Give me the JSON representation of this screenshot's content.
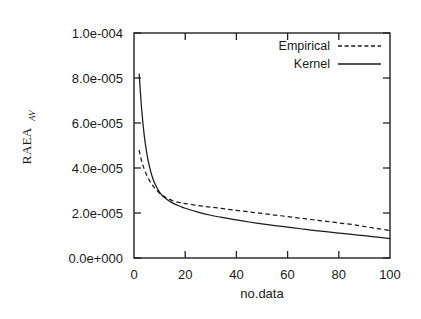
{
  "chart_data": {
    "type": "line",
    "title": "",
    "subtitle": "",
    "xlabel": "no.data",
    "ylabel": "RAEA",
    "ylabel_subscript": "AV",
    "xlim": [
      0,
      100
    ],
    "ylim": [
      0,
      0.0001
    ],
    "grid": false,
    "legend_position": "top-right-inside",
    "xticks": [
      0,
      20,
      40,
      60,
      80,
      100
    ],
    "xtick_labels": [
      "0",
      "20",
      "40",
      "60",
      "80",
      "100"
    ],
    "yticks": [
      0,
      2e-05,
      4e-05,
      6e-05,
      8e-05,
      0.0001
    ],
    "ytick_labels": [
      "0.0e+000",
      "2.0e-005",
      "4.0e-005",
      "6.0e-005",
      "8.0e-005",
      "1.0e-004"
    ],
    "series": [
      {
        "name": "Empirical",
        "style": "dashed",
        "color": "#1a1a1a",
        "x": [
          2,
          3,
          4,
          5,
          6,
          7,
          8,
          10,
          12,
          15,
          18,
          20,
          25,
          30,
          35,
          40,
          45,
          50,
          55,
          60,
          65,
          70,
          75,
          80,
          85,
          90,
          95,
          100
        ],
        "y": [
          4.8e-05,
          4.3e-05,
          3.95e-05,
          3.67e-05,
          3.45e-05,
          3.27e-05,
          3.12e-05,
          2.88e-05,
          2.72e-05,
          2.55e-05,
          2.46e-05,
          2.42e-05,
          2.33e-05,
          2.26e-05,
          2.19e-05,
          2.12e-05,
          2.05e-05,
          1.98e-05,
          1.91e-05,
          1.84e-05,
          1.77e-05,
          1.7e-05,
          1.63e-05,
          1.56e-05,
          1.49e-05,
          1.4e-05,
          1.31e-05,
          1.22e-05
        ]
      },
      {
        "name": "Kernel",
        "style": "solid",
        "color": "#1a1a1a",
        "x": [
          2,
          3,
          4,
          5,
          6,
          7,
          8,
          10,
          12,
          15,
          18,
          20,
          25,
          30,
          35,
          40,
          45,
          50,
          55,
          60,
          65,
          70,
          75,
          80,
          85,
          90,
          95,
          100
        ],
        "y": [
          8.2e-05,
          6.6e-05,
          5.45e-05,
          4.65e-05,
          4.08e-05,
          3.66e-05,
          3.34e-05,
          2.92e-05,
          2.68e-05,
          2.45e-05,
          2.3e-05,
          2.21e-05,
          2.04e-05,
          1.9e-05,
          1.79e-05,
          1.69e-05,
          1.6e-05,
          1.52e-05,
          1.44e-05,
          1.37e-05,
          1.3e-05,
          1.23e-05,
          1.17e-05,
          1.11e-05,
          1.05e-05,
          9.9e-06,
          9.3e-06,
          8.6e-06
        ]
      }
    ],
    "legend_entries": [
      {
        "label": "Empirical",
        "style": "dashed"
      },
      {
        "label": "Kernel",
        "style": "solid"
      }
    ]
  }
}
